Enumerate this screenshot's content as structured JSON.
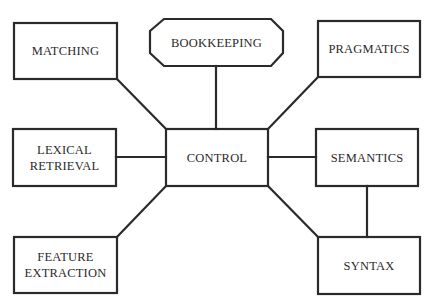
{
  "diagram": {
    "type": "hub-and-spoke block diagram",
    "stroke_color": "#2a2a2a",
    "nodes": {
      "matching": {
        "label": "MATCHING",
        "shape": "rectangle"
      },
      "bookkeeping": {
        "label": "BOOKKEEPING",
        "shape": "octagon"
      },
      "pragmatics": {
        "label": "PRAGMATICS",
        "shape": "rectangle"
      },
      "lexical": {
        "label_line1": "LEXICAL",
        "label_line2": "RETRIEVAL",
        "shape": "rectangle"
      },
      "control": {
        "label": "CONTROL",
        "shape": "rectangle"
      },
      "semantics": {
        "label": "SEMANTICS",
        "shape": "rectangle"
      },
      "feature": {
        "label_line1": "FEATURE",
        "label_line2": "EXTRACTION",
        "shape": "rectangle"
      },
      "syntax": {
        "label": "SYNTAX",
        "shape": "rectangle"
      }
    },
    "edges": [
      [
        "CONTROL",
        "MATCHING"
      ],
      [
        "CONTROL",
        "BOOKKEEPING"
      ],
      [
        "CONTROL",
        "PRAGMATICS"
      ],
      [
        "CONTROL",
        "LEXICAL RETRIEVAL"
      ],
      [
        "CONTROL",
        "SEMANTICS"
      ],
      [
        "CONTROL",
        "FEATURE EXTRACTION"
      ],
      [
        "CONTROL",
        "SYNTAX"
      ],
      [
        "SEMANTICS",
        "SYNTAX"
      ]
    ]
  }
}
